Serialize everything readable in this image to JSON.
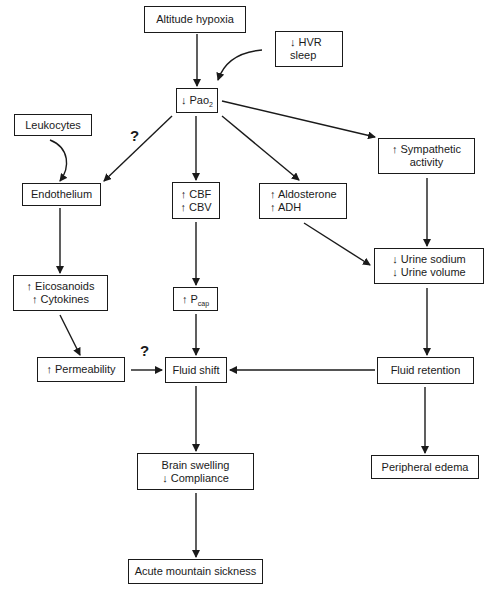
{
  "diagram": {
    "nodes": {
      "altitude_hypoxia": {
        "lines": [
          "Altitude hypoxia"
        ]
      },
      "hvr_sleep": {
        "lines": [
          "↓ HVR",
          "sleep"
        ]
      },
      "pao2": {
        "prefix": "↓ Pao",
        "sub": "2"
      },
      "leukocytes": {
        "lines": [
          "Leukocytes"
        ]
      },
      "endothelium": {
        "lines": [
          "Endothelium"
        ]
      },
      "cbf_cbv": {
        "lines": [
          "↑ CBF",
          "↑ CBV"
        ]
      },
      "aldosterone_adh": {
        "lines": [
          "↑ Aldosterone",
          "↑ ADH"
        ]
      },
      "sympathetic": {
        "lines": [
          "↑ Sympathetic",
          "activity"
        ]
      },
      "eicosanoids_cytokines": {
        "lines": [
          "↑ Eicosanoids",
          "↑ Cytokines"
        ]
      },
      "pcap": {
        "prefix": "↑ P",
        "sub": "cap"
      },
      "urine": {
        "lines": [
          "↓ Urine sodium",
          "↓ Urine volume"
        ]
      },
      "permeability": {
        "lines": [
          "↑ Permeability"
        ]
      },
      "fluid_shift": {
        "lines": [
          "Fluid shift"
        ]
      },
      "fluid_retention": {
        "lines": [
          "Fluid retention"
        ]
      },
      "brain_swelling": {
        "lines": [
          "Brain swelling",
          "↓ Compliance"
        ]
      },
      "peripheral_edema": {
        "lines": [
          "Peripheral edema"
        ]
      },
      "ams": {
        "lines": [
          "Acute mountain sickness"
        ]
      }
    },
    "annotations": {
      "uncertain_pao2_endothelium": "?",
      "uncertain_permeability_fluidshift": "?"
    },
    "edges": [
      [
        "altitude_hypoxia",
        "pao2"
      ],
      [
        "hvr_sleep",
        "pao2"
      ],
      [
        "pao2",
        "endothelium"
      ],
      [
        "pao2",
        "cbf_cbv"
      ],
      [
        "pao2",
        "aldosterone_adh"
      ],
      [
        "pao2",
        "sympathetic"
      ],
      [
        "leukocytes",
        "endothelium"
      ],
      [
        "endothelium",
        "eicosanoids_cytokines"
      ],
      [
        "eicosanoids_cytokines",
        "permeability"
      ],
      [
        "permeability",
        "fluid_shift"
      ],
      [
        "cbf_cbv",
        "pcap"
      ],
      [
        "pcap",
        "fluid_shift"
      ],
      [
        "aldosterone_adh",
        "urine"
      ],
      [
        "sympathetic",
        "urine"
      ],
      [
        "urine",
        "fluid_retention"
      ],
      [
        "fluid_retention",
        "fluid_shift"
      ],
      [
        "fluid_retention",
        "peripheral_edema"
      ],
      [
        "fluid_shift",
        "brain_swelling"
      ],
      [
        "brain_swelling",
        "ams"
      ]
    ]
  }
}
